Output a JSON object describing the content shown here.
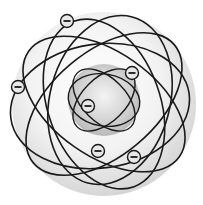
{
  "diagram": {
    "colors": {
      "background": "#ffffff",
      "outer_shell": "#e6e6e6",
      "nucleus": "#c8c8c8",
      "orbit": "#1a1a1a",
      "electron_fill": "#e8e8e8"
    },
    "electron_symbol": "−",
    "electrons": [
      {
        "x": 67,
        "y": 21
      },
      {
        "x": 18,
        "y": 87
      },
      {
        "x": 132,
        "y": 73
      },
      {
        "x": 88,
        "y": 106
      },
      {
        "x": 98,
        "y": 151
      },
      {
        "x": 134,
        "y": 157
      }
    ]
  }
}
